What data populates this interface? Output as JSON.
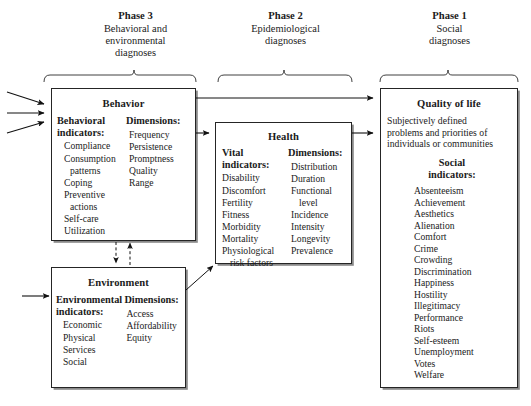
{
  "figure": {
    "type": "flow-diagram"
  },
  "phases": [
    {
      "id": "phase-3",
      "title": "Phase 3",
      "subtitle_lines": [
        "Behavioral and",
        "environmental",
        "diagnoses"
      ]
    },
    {
      "id": "phase-2",
      "title": "Phase 2",
      "subtitle_lines": [
        "Epidemiological",
        "diagnoses"
      ]
    },
    {
      "id": "phase-1",
      "title": "Phase 1",
      "subtitle_lines": [
        "Social",
        "diagnoses"
      ]
    }
  ],
  "boxes": {
    "behavior": {
      "title": "Behavior",
      "left_heading_lines": [
        "Behavioral",
        "indicators:"
      ],
      "left_items": [
        "Compliance",
        "Consumption",
        "patterns",
        "Coping",
        "Preventive",
        "actions",
        "Self-care",
        "Utilization"
      ],
      "right_heading_lines": [
        "Dimensions:"
      ],
      "right_items": [
        "Frequency",
        "Persistence",
        "Promptness",
        "Quality",
        "Range"
      ]
    },
    "environment": {
      "title": "Environment",
      "left_heading_lines": [
        "Environmental",
        "indicators:"
      ],
      "left_items": [
        "Economic",
        "Physical",
        "Services",
        "Social"
      ],
      "right_heading_lines": [
        "Dimensions:"
      ],
      "right_items": [
        "Access",
        "Affordability",
        "Equity"
      ]
    },
    "health": {
      "title": "Health",
      "left_heading_lines": [
        "Vital",
        "indicators:"
      ],
      "left_items": [
        "Disability",
        "Discomfort",
        "Fertility",
        "Fitness",
        "Morbidity",
        "Mortality",
        "Physiological",
        "risk factors"
      ],
      "right_heading_lines": [
        "Dimensions:"
      ],
      "right_items": [
        "Distribution",
        "Duration",
        "Functional",
        "level",
        "Incidence",
        "Intensity",
        "Longevity",
        "Prevalence"
      ]
    },
    "quality_of_life": {
      "title": "Quality of life",
      "description_lines": [
        "Subjectively defined",
        "problems and priorities of",
        "individuals or communities"
      ],
      "sub_heading_lines": [
        "Social",
        "indicators:"
      ],
      "items": [
        "Absenteeism",
        "Achievement",
        "Aesthetics",
        "Alienation",
        "Comfort",
        "Crime",
        "Crowding",
        "Discrimination",
        "Happiness",
        "Hostility",
        "Illegitimacy",
        "Performance",
        "Riots",
        "Self-esteem",
        "Unemployment",
        "Votes",
        "Welfare"
      ]
    }
  },
  "connectors": [
    {
      "name": "inbound-arrow-top",
      "style": "solid",
      "from": "left-margin",
      "to": "behavior"
    },
    {
      "name": "inbound-arrow-middle",
      "style": "solid",
      "from": "left-margin",
      "to": "behavior"
    },
    {
      "name": "inbound-arrow-bottom",
      "style": "solid",
      "from": "left-margin",
      "to": "behavior"
    },
    {
      "name": "inbound-arrow-environment",
      "style": "solid",
      "from": "left-margin",
      "to": "environment"
    },
    {
      "name": "behavior-to-health",
      "style": "solid",
      "from": "behavior",
      "to": "health"
    },
    {
      "name": "behavior-to-quality-of-life",
      "style": "solid",
      "from": "behavior",
      "to": "quality_of_life"
    },
    {
      "name": "health-to-quality-of-life",
      "style": "solid",
      "from": "health",
      "to": "quality_of_life"
    },
    {
      "name": "environment-to-health",
      "style": "solid",
      "from": "environment",
      "to": "health"
    },
    {
      "name": "behavior-to-environment",
      "style": "dashed",
      "from": "behavior",
      "to": "environment"
    },
    {
      "name": "environment-to-behavior",
      "style": "dashed",
      "from": "environment",
      "to": "behavior"
    }
  ],
  "colors": {
    "ink": "#1b1b1b",
    "border": "#252525",
    "shadow": "#8a8a8a",
    "background": "#ffffff"
  }
}
